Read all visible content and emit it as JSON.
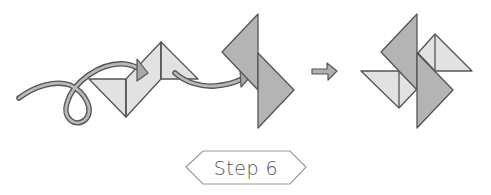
{
  "step": {
    "label": "Step 6"
  },
  "colors": {
    "light_paper": "#e2e2e2",
    "dark_paper": "#b4b4b4",
    "outline": "#555555",
    "arrow_fill": "#b0b0b0",
    "badge_border": "#9a9a9a",
    "text": "#555555"
  },
  "figures": [
    {
      "name": "folding-in-progress",
      "description": "Two light triangles joined, with curved fold arrows"
    },
    {
      "name": "dark-flaps",
      "description": "Two dark triangles offset along a vertical crease"
    },
    {
      "name": "result-arrow",
      "description": "Small arrow pointing to the result"
    },
    {
      "name": "completed-pinwheel",
      "description": "Pinwheel with two dark and two light triangles"
    }
  ]
}
